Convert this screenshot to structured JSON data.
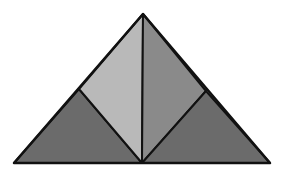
{
  "diagram": {
    "background": "#ffffff",
    "stroke": "#111111",
    "points": {
      "apex": [
        143,
        14
      ],
      "base_left": [
        14,
        163
      ],
      "base_right": [
        270,
        163
      ],
      "base_mid": [
        142,
        163
      ],
      "left_mid": [
        79,
        89
      ],
      "right_mid": [
        206,
        91
      ]
    },
    "regions": [
      {
        "name": "left-lower-triangle",
        "fill": "#6b6b6b"
      },
      {
        "name": "left-upper-triangle",
        "fill": "#b9b9b9"
      },
      {
        "name": "right-upper-triangle",
        "fill": "#8a8a8a"
      },
      {
        "name": "right-lower-triangle",
        "fill": "#6b6b6b"
      }
    ]
  }
}
